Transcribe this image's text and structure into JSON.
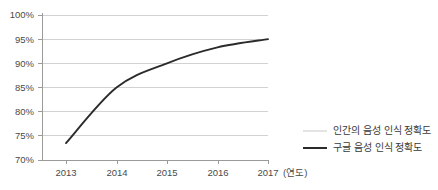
{
  "chart_data": {
    "type": "line",
    "title": "",
    "xlabel": "(연도)",
    "ylabel": "",
    "ylim": [
      70,
      100
    ],
    "xlim": [
      2012.5,
      2017.0
    ],
    "grid": true,
    "legend_position": "right-bottom",
    "x": [
      "2013",
      "2014",
      "2015",
      "2016",
      "2017"
    ],
    "ytick_labels": [
      "100%",
      "95%",
      "90%",
      "85%",
      "80%",
      "75%",
      "70%"
    ],
    "ytick_values": [
      100,
      95,
      90,
      85,
      80,
      75,
      70
    ],
    "xtick_labels": [
      "2013",
      "2014",
      "2015",
      "2016",
      "2017"
    ],
    "series": [
      {
        "name": "인간의 음성 인식 정확도",
        "color": "#c9c9c9",
        "values": [
          null,
          null,
          null,
          null,
          null
        ],
        "visible_in_plot": false
      },
      {
        "name": "구글 음성 인식 정확도",
        "color": "#2b2b2b",
        "values": [
          73.5,
          85.0,
          90.0,
          93.3,
          95.0
        ]
      }
    ]
  },
  "legend": {
    "entries": [
      {
        "label": "인간의 음성 인식 정확도",
        "swatch": "thin-gray-line"
      },
      {
        "label": "구글 음성 인식 정확도",
        "swatch": "thick-black-line"
      }
    ]
  },
  "axis": {
    "x_caption": "(연도)",
    "y_ticks": [
      "100%",
      "95%",
      "90%",
      "85%",
      "80%",
      "75%",
      "70%"
    ],
    "x_ticks": [
      "2013",
      "2014",
      "2015",
      "2016",
      "2017"
    ]
  },
  "colors": {
    "gridline": "#d2d2d2",
    "axis": "#9a9a9a",
    "series_google": "#2b2b2b",
    "series_human": "#c9c9c9",
    "text": "#4a4a4a",
    "background": "#ffffff"
  }
}
